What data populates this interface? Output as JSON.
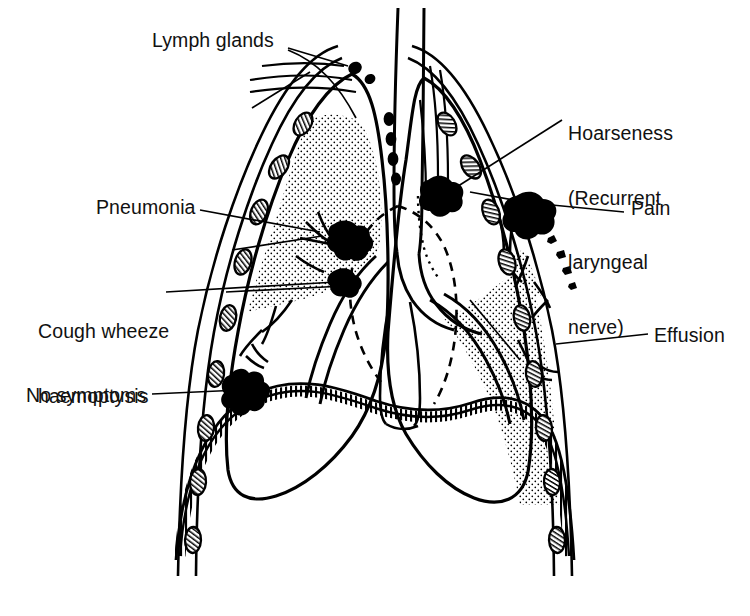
{
  "diagram": {
    "type": "anatomical-line-drawing",
    "view": "coronal section of chest (thorax) showing both lungs, trachea, bronchial tree, heart outline, ribs and diaphragm",
    "ink_color": "#000000",
    "background_color": "#ffffff",
    "stipple_color": "#000000"
  },
  "labels": [
    {
      "id": "lymph-glands",
      "text": "Lymph glands",
      "x": 152,
      "y": 30,
      "lines": [
        "Lymph glands"
      ]
    },
    {
      "id": "hoarseness",
      "text": "Hoarseness (Recurrent laryngeal nerve)",
      "x": 568,
      "y": 80,
      "lines": [
        "Hoarseness",
        "(Recurrent",
        "laryngeal",
        "nerve)"
      ]
    },
    {
      "id": "pneumonia",
      "text": "Pneumonia",
      "x": 96,
      "y": 197,
      "lines": [
        "Pneumonia"
      ]
    },
    {
      "id": "pain",
      "text": "Pain",
      "x": 631,
      "y": 198,
      "lines": [
        "Pain"
      ]
    },
    {
      "id": "cough-wheeze-haemoptysis",
      "text": "Cough wheeze haemoptysis",
      "x": 38,
      "y": 278,
      "lines": [
        "Cough wheeze",
        "haemoptysis"
      ]
    },
    {
      "id": "effusion",
      "text": "Effusion",
      "x": 654,
      "y": 325,
      "lines": [
        "Effusion"
      ]
    },
    {
      "id": "no-symptoms",
      "text": "No symptoms",
      "x": 26,
      "y": 385,
      "lines": [
        "No symptoms"
      ]
    }
  ],
  "features": {
    "lymph_nodes": {
      "count": 5,
      "description": "small solid black oval nodes near the apex and alongside the trachea"
    },
    "tumour_masses": [
      {
        "id": "left-hilar-mass",
        "label_ref": "pneumonia",
        "description": "irregular black mass at left hilum obstructing a bronchus, distal lung stippled (consolidation)"
      },
      {
        "id": "left-lower-mass",
        "label_ref": "cough-wheeze-haemoptysis",
        "description": "irregular black mass in left main bronchus"
      },
      {
        "id": "central-mass",
        "label_ref": "hoarseness",
        "description": "irregular black mass beside the trachea involving the recurrent laryngeal nerve (dotted path)"
      },
      {
        "id": "right-apical-peripheral-mass",
        "label_ref": "pain",
        "description": "irregular black mass invading the chest wall / pleura with satellite deposits"
      },
      {
        "id": "left-peripheral-nodule",
        "label_ref": "no-symptoms",
        "description": "solitary star-shaped peripheral nodule, asymptomatic"
      }
    ],
    "pleural_effusion": {
      "label_ref": "effusion",
      "description": "stippled fluid collection filling the right pleural space from mid-chest to the diaphragm"
    },
    "consolidation": {
      "label_ref": "pneumonia",
      "description": "stippled wedge of collapsed / consolidated lung in the left upper zone distal to the obstructing tumour"
    },
    "heart_outline": {
      "style": "dashed",
      "description": "dashed line indicating the cardiac silhouette in the mediastinum"
    },
    "nerve_path": {
      "style": "dotted",
      "description": "dotted line tracing the recurrent laryngeal nerve from the tumour"
    },
    "diaphragm": {
      "style": "hatched band",
      "description": "striated muscular dome forming the floor of the thorax"
    },
    "ribs": {
      "count": 18,
      "description": "oval rib cross-sections with internal hatching running down both chest walls"
    },
    "trachea": {
      "description": "vertical midline airway dividing into left and right main bronchi"
    }
  }
}
